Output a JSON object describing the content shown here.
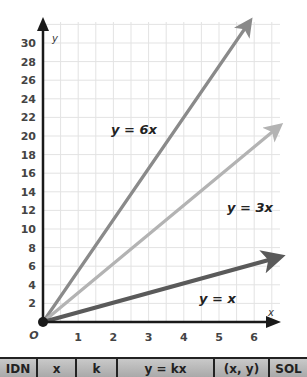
{
  "chart_data": {
    "type": "line",
    "title": "",
    "xlabel": "x",
    "ylabel": "y",
    "xlim": [
      0,
      6.5
    ],
    "ylim": [
      0,
      31
    ],
    "x_ticks": [
      "1",
      "2",
      "3",
      "4",
      "5",
      "6"
    ],
    "y_ticks": [
      "2",
      "4",
      "6",
      "8",
      "10",
      "12",
      "14",
      "16",
      "18",
      "20",
      "22",
      "24",
      "26",
      "28",
      "30"
    ],
    "origin_label": "O",
    "grid": true,
    "legend": "none (inline labels)",
    "series": [
      {
        "name": "y = 6x",
        "slope": 6,
        "x": [
          0,
          5.9
        ],
        "values": [
          0,
          35.5
        ],
        "color": "#8a8a8a",
        "label_text": "y = 6x"
      },
      {
        "name": "y = 3x",
        "slope": 3,
        "x": [
          0,
          6.7
        ],
        "values": [
          0,
          20.2
        ],
        "color": "#b3b3b3",
        "label_text": "y = 3x"
      },
      {
        "name": "y = x",
        "slope": 1,
        "x": [
          0,
          6.7
        ],
        "values": [
          0,
          6.7
        ],
        "color": "#5a5a5a",
        "label_text": "y = x"
      }
    ],
    "annotations": [
      "y = 6x",
      "y = 3x",
      "y = x"
    ]
  },
  "axes": {
    "x_label": "x",
    "y_label": "y",
    "origin": "O"
  },
  "table": {
    "headers": [
      "IDN",
      "x",
      "k",
      "y = kx",
      "(x, y)",
      "SOL"
    ]
  },
  "colors": {
    "axis": "#1a1a1a",
    "grid": "#e3e3e3",
    "line_6x": "#8a8a8a",
    "line_3x": "#b3b3b3",
    "line_x": "#5a5a5a",
    "table_header_bg": "#b5b5b5"
  }
}
